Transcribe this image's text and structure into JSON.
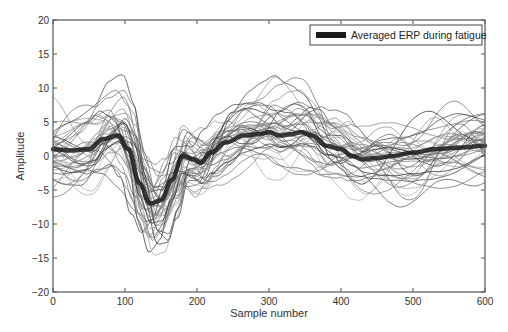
{
  "chart_data": {
    "type": "line",
    "title": "",
    "xlabel": "Sample number",
    "ylabel": "Amplitude",
    "xlim": [
      0,
      600
    ],
    "ylim": [
      -20,
      20
    ],
    "xticks": [
      0,
      100,
      200,
      300,
      400,
      500,
      600
    ],
    "yticks": [
      -20,
      -15,
      -10,
      -5,
      0,
      5,
      10,
      15,
      20
    ],
    "grid": false,
    "legend": {
      "position": "upper right",
      "entries": [
        "Averaged ERP during fatigue"
      ]
    },
    "series": [
      {
        "name": "Averaged ERP during fatigue",
        "style": "thick black line",
        "x": [
          0,
          25,
          50,
          70,
          90,
          105,
          120,
          135,
          150,
          165,
          180,
          195,
          205,
          220,
          240,
          265,
          285,
          300,
          315,
          330,
          345,
          360,
          380,
          400,
          415,
          430,
          450,
          470,
          500,
          530,
          560,
          600
        ],
        "values": [
          1.0,
          0.8,
          1.0,
          2.5,
          3.0,
          1.0,
          -4.0,
          -7.0,
          -6.5,
          -3.5,
          0.0,
          -0.5,
          -1.0,
          0.5,
          2.0,
          3.0,
          3.2,
          3.5,
          3.0,
          3.2,
          3.5,
          3.0,
          1.5,
          1.0,
          0.0,
          -0.5,
          -0.3,
          0.0,
          0.5,
          1.0,
          1.2,
          1.5
        ]
      },
      {
        "name": "Individual trials (≈40 overlaid, unlabeled)",
        "style": "thin gray lines",
        "count": 40,
        "value_range": [
          -18,
          15
        ],
        "notable_extremes": [
          {
            "x": 70,
            "y": 14.5
          },
          {
            "x": 265,
            "y": 15
          },
          {
            "x": 150,
            "y": -18
          },
          {
            "x": 435,
            "y": -15
          },
          {
            "x": 590,
            "y": 12
          }
        ]
      }
    ]
  }
}
